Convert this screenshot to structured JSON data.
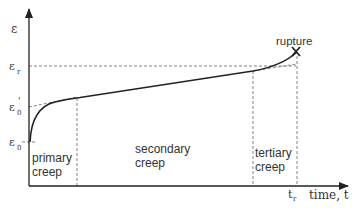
{
  "diagram": {
    "y_axis": {
      "label": "ε",
      "ticks": [
        {
          "label": "ε",
          "sub": "r",
          "y": 66
        },
        {
          "label": "ε",
          "sub": "0",
          "sup": "'",
          "y": 107
        },
        {
          "label": "ε",
          "sub": "0",
          "y": 142
        }
      ]
    },
    "x_axis": {
      "label": "time, t",
      "tick": {
        "label": "t",
        "sub": "r"
      }
    },
    "regions": [
      {
        "line1": "primary",
        "line2": "creep"
      },
      {
        "line1": "secondary",
        "line2": "creep"
      },
      {
        "line1": "tertiary",
        "line2": "creep"
      }
    ],
    "annotation": {
      "text": "rupture",
      "marker": "X"
    },
    "colors": {
      "stroke": "#222222",
      "dashed": "#777777",
      "text": "#333333"
    }
  }
}
